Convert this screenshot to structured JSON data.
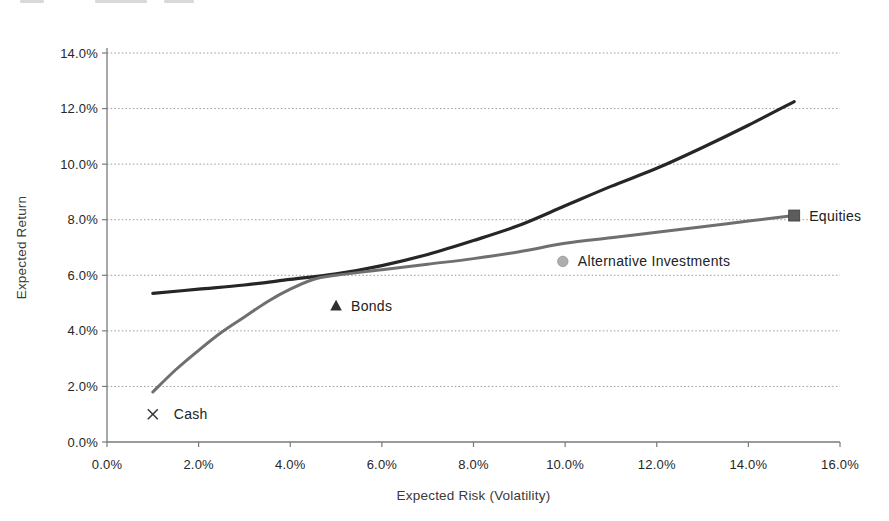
{
  "chart_data": {
    "type": "line",
    "title": "",
    "xlabel": "Expected Risk (Volatility)",
    "ylabel": "Expected Return",
    "xlim": [
      0,
      16
    ],
    "ylim": [
      0,
      14
    ],
    "grid": "horizontal-dotted",
    "legend": "none",
    "x_ticks": [
      {
        "value": 0,
        "label": "0.0%"
      },
      {
        "value": 2,
        "label": "2.0%"
      },
      {
        "value": 4,
        "label": "4.0%"
      },
      {
        "value": 6,
        "label": "6.0%"
      },
      {
        "value": 8,
        "label": "8.0%"
      },
      {
        "value": 10,
        "label": "10.0%"
      },
      {
        "value": 12,
        "label": "12.0%"
      },
      {
        "value": 14,
        "label": "14.0%"
      },
      {
        "value": 16,
        "label": "16.0%"
      }
    ],
    "y_ticks": [
      {
        "value": 0,
        "label": "0.0%"
      },
      {
        "value": 2,
        "label": "2.0%"
      },
      {
        "value": 4,
        "label": "4.0%"
      },
      {
        "value": 6,
        "label": "6.0%"
      },
      {
        "value": 8,
        "label": "8.0%"
      },
      {
        "value": 10,
        "label": "10.0%"
      },
      {
        "value": 12,
        "label": "12.0%"
      },
      {
        "value": 14,
        "label": "14.0%"
      }
    ],
    "series": [
      {
        "name": "frontier-with-alternatives",
        "color": "#262626",
        "stroke_width": 3.2,
        "points": [
          [
            1,
            5.35
          ],
          [
            2,
            5.5
          ],
          [
            3,
            5.65
          ],
          [
            4,
            5.85
          ],
          [
            5,
            6.05
          ],
          [
            6,
            6.35
          ],
          [
            7,
            6.75
          ],
          [
            8,
            7.25
          ],
          [
            9,
            7.8
          ],
          [
            10,
            8.5
          ],
          [
            11,
            9.2
          ],
          [
            12,
            9.85
          ],
          [
            13,
            10.6
          ],
          [
            14,
            11.4
          ],
          [
            15,
            12.25
          ]
        ]
      },
      {
        "name": "asset-class-frontier",
        "color": "#6f6f6f",
        "stroke_width": 3.0,
        "points": [
          [
            1,
            1.8
          ],
          [
            1.5,
            2.6
          ],
          [
            2,
            3.3
          ],
          [
            2.5,
            3.95
          ],
          [
            3,
            4.5
          ],
          [
            3.5,
            5.05
          ],
          [
            4,
            5.5
          ],
          [
            4.5,
            5.85
          ],
          [
            5,
            6.0
          ],
          [
            6,
            6.2
          ],
          [
            7,
            6.4
          ],
          [
            8,
            6.6
          ],
          [
            9,
            6.85
          ],
          [
            10,
            7.15
          ],
          [
            11,
            7.35
          ],
          [
            12,
            7.55
          ],
          [
            13,
            7.75
          ],
          [
            14,
            7.95
          ],
          [
            15,
            8.15
          ]
        ]
      }
    ],
    "markers": [
      {
        "name": "cash",
        "label": "Cash",
        "shape": "x",
        "color": "#3a3a3a",
        "x": 1.0,
        "y": 1.0
      },
      {
        "name": "bonds",
        "label": "Bonds",
        "shape": "triangle",
        "color": "#2f2f2f",
        "x": 5.0,
        "y": 4.9
      },
      {
        "name": "alternative-investments",
        "label": "Alternative Investments",
        "shape": "circle",
        "color": "#aeaeae",
        "x": 9.95,
        "y": 6.5
      },
      {
        "name": "equities",
        "label": "Equities",
        "shape": "square",
        "color": "#5c5c5c",
        "x": 15.0,
        "y": 8.15
      }
    ],
    "style": {
      "gridline_color": "#9a9a9a",
      "axis_color": "#7a7a7a",
      "background": "#ffffff"
    }
  }
}
